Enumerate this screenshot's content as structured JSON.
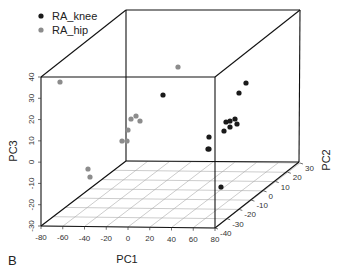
{
  "chart_data": {
    "type": "scatter",
    "subtype": "3d",
    "panel_label": "B",
    "title": "",
    "xlabel": "PC1",
    "ylabel": "PC2",
    "zlabel": "PC3",
    "xlim": [
      -80,
      80
    ],
    "ylim": [
      -40,
      30
    ],
    "zlim": [
      -30,
      40
    ],
    "x_ticks": [
      -80,
      -60,
      -40,
      -20,
      0,
      20,
      40,
      60,
      80
    ],
    "y_ticks": [
      -40,
      -30,
      -20,
      -10,
      0,
      10,
      20,
      30
    ],
    "z_ticks": [
      -30,
      -20,
      -10,
      0,
      10,
      20,
      30,
      40
    ],
    "grid": "floor",
    "legend_position": "top-left",
    "series": [
      {
        "name": "RA_knee",
        "color": "#1a1a1a",
        "points_screen_est": [
          {
            "px": 246,
            "py": 83
          },
          {
            "px": 239,
            "py": 93
          },
          {
            "px": 230,
            "py": 121
          },
          {
            "px": 235,
            "py": 119
          },
          {
            "px": 237,
            "py": 124
          },
          {
            "px": 226,
            "py": 122
          },
          {
            "px": 230,
            "py": 127
          },
          {
            "px": 224,
            "py": 131
          },
          {
            "px": 209,
            "py": 137
          },
          {
            "px": 209,
            "py": 149
          },
          {
            "px": 208,
            "py": 149
          },
          {
            "px": 163,
            "py": 95
          },
          {
            "px": 221,
            "py": 187
          }
        ]
      },
      {
        "name": "RA_hip",
        "color": "#8c8c8c",
        "points_screen_est": [
          {
            "px": 60,
            "py": 82
          },
          {
            "px": 178,
            "py": 67
          },
          {
            "px": 136,
            "py": 116
          },
          {
            "px": 131,
            "py": 119
          },
          {
            "px": 140,
            "py": 121
          },
          {
            "px": 128,
            "py": 130
          },
          {
            "px": 122,
            "py": 141
          },
          {
            "px": 127,
            "py": 141
          },
          {
            "px": 88,
            "py": 169
          },
          {
            "px": 90,
            "py": 177
          }
        ]
      }
    ]
  }
}
